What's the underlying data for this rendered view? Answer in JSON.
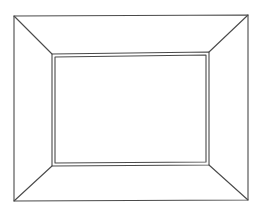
{
  "drawing": {
    "subject": "empty picture frame line drawing",
    "stroke_color": "#4a4a4a",
    "background": "#ffffff",
    "outer": [
      [
        14,
        16
      ],
      [
        248,
        15
      ],
      [
        248,
        200
      ],
      [
        14,
        201
      ]
    ],
    "inner": [
      [
        52,
        54
      ],
      [
        209,
        52
      ],
      [
        209,
        165
      ],
      [
        52,
        166
      ]
    ]
  }
}
